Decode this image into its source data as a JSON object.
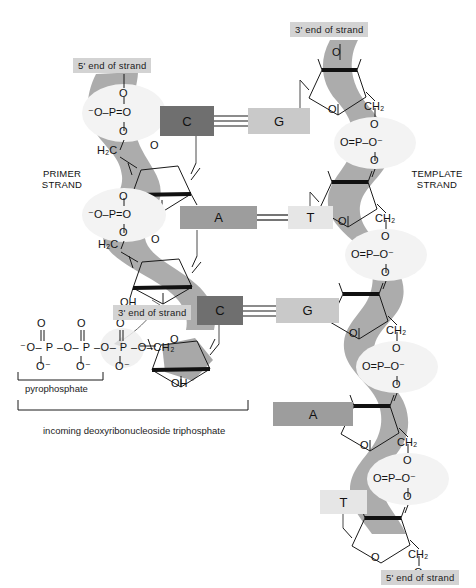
{
  "figure": {
    "background_color": "#ffffff",
    "backbone_color": "#a8a8a8",
    "phosphate_circle_color": "#f2f2f2"
  },
  "end_labels": {
    "primer_5_prime": "5' end of strand",
    "primer_3_prime": "3' end of strand",
    "template_3_prime": "3' end of strand",
    "template_5_prime": "5' end of strand"
  },
  "strand_labels": {
    "primer_line1": "PRIMER",
    "primer_line2": "STRAND",
    "template_line1": "TEMPLATE",
    "template_line2": "STRAND"
  },
  "base_pairs": [
    {
      "left_base": "C",
      "right_base": "G",
      "left_color": "#6f6f6f",
      "right_color": "#c9c9c9",
      "hydrogen_bonds": 3,
      "paired": true
    },
    {
      "left_base": "A",
      "right_base": "T",
      "left_color": "#9d9d9d",
      "right_color": "#e6e6e6",
      "hydrogen_bonds": 2,
      "paired": true
    },
    {
      "left_base": "C",
      "right_base": "G",
      "left_color": "#6f6f6f",
      "right_color": "#c9c9c9",
      "hydrogen_bonds": 3,
      "paired": true
    }
  ],
  "unpaired_template_bases": [
    {
      "base": "A",
      "color": "#9d9d9d"
    },
    {
      "base": "T",
      "color": "#e6e6e6"
    }
  ],
  "annotations": {
    "pyrophosphate": "pyrophosphate",
    "incoming_nucleotide": "incoming deoxyribonucleoside triphosphate"
  },
  "chemistry": {
    "phosphate_left_top": {
      "top_o": "O",
      "line": "⁻O–P=O",
      "bottom_o": "O"
    },
    "phosphate_left_mid": {
      "top_o": "O",
      "line": "⁻O–P=O",
      "bottom_o": "O"
    },
    "phosphate_right": {
      "top_o": "O",
      "line": "O=P–O⁻",
      "bottom_o": "O"
    },
    "methylene_left": "H₂C",
    "methylene_right": "CH₂",
    "ring_oxygen": "O",
    "hydroxyl": "OH",
    "triphosphate_chain": "⁻O– P –O– P –O– P –O–CH₂",
    "triphosphate_top_o": "O",
    "triphosphate_bottom_o": "O⁻"
  }
}
